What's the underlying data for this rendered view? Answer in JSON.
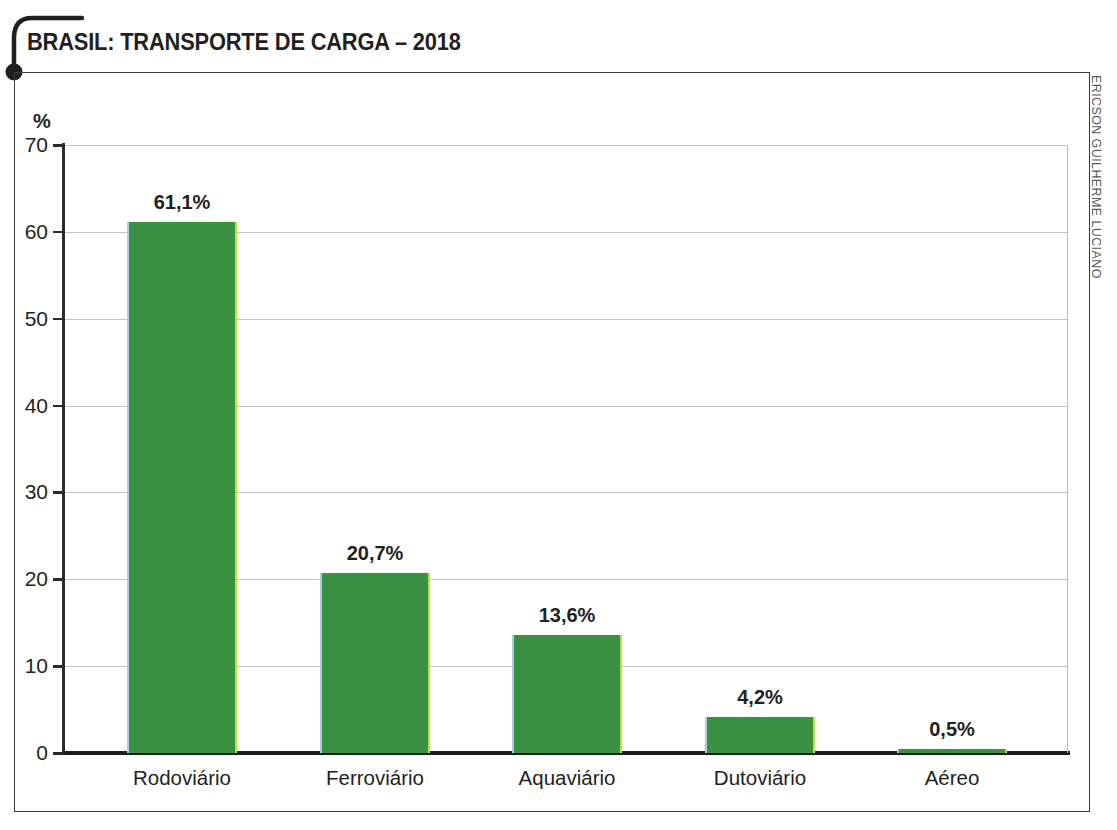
{
  "title": "BRASIL: TRANSPORTE DE CARGA – 2018",
  "credit": "ERICSON GUILHERME LUCIANO",
  "unit_label": "%",
  "chart_data": {
    "type": "bar",
    "title": "BRASIL: TRANSPORTE DE CARGA – 2018",
    "xlabel": "",
    "ylabel": "%",
    "ylim": [
      0,
      70
    ],
    "yticks": [
      0,
      10,
      20,
      30,
      40,
      50,
      60,
      70
    ],
    "ytick_labels": [
      "0",
      "10",
      "20",
      "30",
      "40",
      "50",
      "60",
      "70"
    ],
    "grid": true,
    "legend": false,
    "bar_color": "#3a9142",
    "categories": [
      "Rodoviário",
      "Ferroviário",
      "Aquaviário",
      "Dutoviário",
      "Aéreo"
    ],
    "values": [
      61.1,
      20.7,
      13.6,
      4.2,
      0.5
    ],
    "value_labels": [
      "61,1%",
      "20,7%",
      "13,6%",
      "4,2%",
      "0,5%"
    ]
  }
}
